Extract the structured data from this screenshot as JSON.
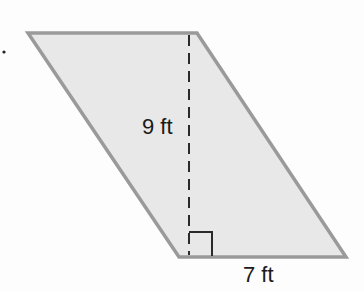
{
  "figure": {
    "shape": "parallelogram",
    "fill": "#e8e8e8",
    "stroke": "#9a9a9a",
    "height_label": "9 ft",
    "base_label": "7 ft",
    "marker": "."
  }
}
